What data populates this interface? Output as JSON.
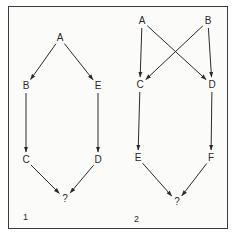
{
  "diagram": {
    "type": "directed-graph-comparison",
    "panels": [
      {
        "label": "1",
        "nodes": [
          {
            "id": "A",
            "label": "A",
            "x": 60,
            "y": 38
          },
          {
            "id": "B",
            "label": "B",
            "x": 26,
            "y": 86
          },
          {
            "id": "E",
            "label": "E",
            "x": 98,
            "y": 86
          },
          {
            "id": "C",
            "label": "C",
            "x": 26,
            "y": 160
          },
          {
            "id": "D",
            "label": "D",
            "x": 98,
            "y": 160
          },
          {
            "id": "Q",
            "label": "?",
            "x": 65,
            "y": 199
          }
        ],
        "edges": [
          {
            "from": "A",
            "to": "B"
          },
          {
            "from": "A",
            "to": "E"
          },
          {
            "from": "B",
            "to": "C"
          },
          {
            "from": "E",
            "to": "D"
          },
          {
            "from": "C",
            "to": "Q"
          },
          {
            "from": "D",
            "to": "Q"
          }
        ]
      },
      {
        "label": "2",
        "nodes": [
          {
            "id": "A",
            "label": "A",
            "x": 142,
            "y": 21
          },
          {
            "id": "B",
            "label": "B",
            "x": 208,
            "y": 21
          },
          {
            "id": "C",
            "label": "C",
            "x": 140,
            "y": 85
          },
          {
            "id": "D",
            "label": "D",
            "x": 212,
            "y": 85
          },
          {
            "id": "E",
            "label": "E",
            "x": 138,
            "y": 158
          },
          {
            "id": "F",
            "label": "F",
            "x": 211,
            "y": 158
          },
          {
            "id": "Q",
            "label": "?",
            "x": 177,
            "y": 202
          }
        ],
        "edges": [
          {
            "from": "A",
            "to": "C"
          },
          {
            "from": "A",
            "to": "D"
          },
          {
            "from": "B",
            "to": "C"
          },
          {
            "from": "B",
            "to": "D"
          },
          {
            "from": "C",
            "to": "E"
          },
          {
            "from": "D",
            "to": "F"
          },
          {
            "from": "E",
            "to": "Q"
          },
          {
            "from": "F",
            "to": "Q"
          }
        ]
      }
    ]
  },
  "colors": {
    "stroke": "#2a2a2a",
    "text": "#2a2a2a",
    "border": "#3a3a3a",
    "background": "#fbfbfa"
  }
}
